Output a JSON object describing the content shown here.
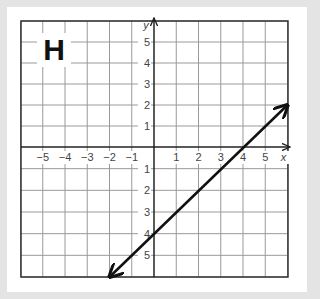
{
  "panel_label": "H",
  "axes": {
    "x_label": "x",
    "y_label": "y",
    "x_ticks": [
      "−5",
      "−4",
      "−3",
      "−2",
      "−1",
      "1",
      "2",
      "3",
      "4",
      "5"
    ],
    "y_ticks_positive": [
      "5",
      "4",
      "3",
      "2",
      "1"
    ],
    "y_ticks_negative": [
      "1",
      "2",
      "3",
      "4",
      "5"
    ]
  },
  "chart_data": {
    "type": "line",
    "title": "H",
    "xlabel": "x",
    "ylabel": "y",
    "xlim": [
      -6,
      6
    ],
    "ylim": [
      -6,
      6
    ],
    "grid": true,
    "series": [
      {
        "name": "line",
        "equation": "y = x - 4",
        "x": [
          -2,
          6
        ],
        "y": [
          -6,
          2
        ],
        "arrows": "both"
      }
    ]
  },
  "colors": {
    "grid": "#9a9a9a",
    "axis": "#222222",
    "line": "#111111",
    "background": "#e4e4e4",
    "card": "#ffffff"
  }
}
